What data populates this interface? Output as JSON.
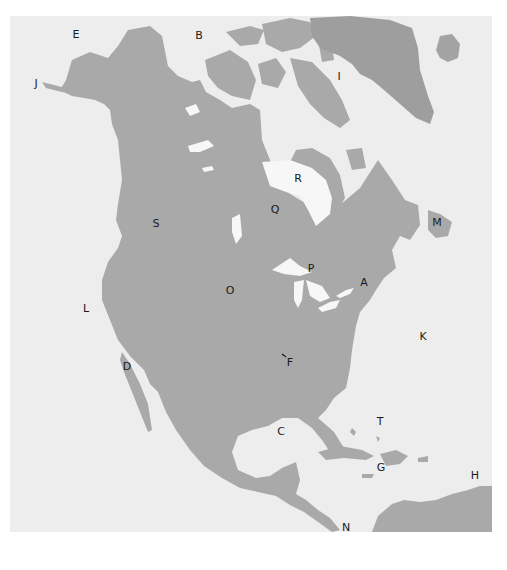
{
  "map": {
    "title": "North America outline map",
    "colors": {
      "page": "#ffffff",
      "ocean": "#ededed",
      "land": "#a9a9a9",
      "land_dark": "#9e9e9e",
      "lake": "#f7f7f7",
      "label": "#1a1a1a"
    },
    "labels": [
      {
        "id": "A",
        "text": "A",
        "region": "Appalachian region / New England"
      },
      {
        "id": "B",
        "text": "B",
        "region": "Beaufort Sea"
      },
      {
        "id": "C",
        "text": "C",
        "region": "Gulf of Mexico"
      },
      {
        "id": "D",
        "text": "D",
        "region": "Baja California"
      },
      {
        "id": "E",
        "text": "E",
        "region": "Bering Strait"
      },
      {
        "id": "F",
        "text": "F",
        "region": "Mississippi River"
      },
      {
        "id": "G",
        "text": "G",
        "region": "Greater Antilles"
      },
      {
        "id": "H",
        "text": "H",
        "region": "Lesser Antilles"
      },
      {
        "id": "I",
        "text": "I",
        "region": "Baffin Bay"
      },
      {
        "id": "J",
        "text": "J",
        "region": "Aleutian Islands"
      },
      {
        "id": "K",
        "text": "K",
        "region": "Atlantic Ocean"
      },
      {
        "id": "L",
        "text": "L",
        "region": "Pacific Ocean"
      },
      {
        "id": "M",
        "text": "M",
        "region": "Newfoundland"
      },
      {
        "id": "N",
        "text": "N",
        "region": "Isthmus of Panama"
      },
      {
        "id": "O",
        "text": "O",
        "region": "Great Plains"
      },
      {
        "id": "P",
        "text": "P",
        "region": "Great Lakes"
      },
      {
        "id": "Q",
        "text": "Q",
        "region": "Canadian Shield"
      },
      {
        "id": "R",
        "text": "R",
        "region": "Hudson Bay"
      },
      {
        "id": "S",
        "text": "S",
        "region": "Rocky Mountains"
      },
      {
        "id": "T",
        "text": "T",
        "region": "Bahamas"
      }
    ]
  }
}
